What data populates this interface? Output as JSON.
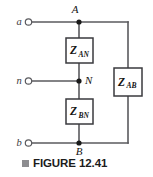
{
  "figure": {
    "caption_marker": "square-marker",
    "caption": "FIGURE 12.41",
    "type": "circuit-diagram"
  },
  "terminals": [
    {
      "id": "a",
      "label": "a",
      "x": 27,
      "y": 22
    },
    {
      "id": "n",
      "label": "n",
      "x": 27,
      "y": 81
    },
    {
      "id": "b",
      "label": "b",
      "x": 27,
      "y": 143
    }
  ],
  "nodes": [
    {
      "id": "A",
      "label": "A",
      "x": 79,
      "y": 22
    },
    {
      "id": "N",
      "label": "N",
      "x": 79,
      "y": 81
    },
    {
      "id": "B",
      "label": "B",
      "x": 79,
      "y": 143
    }
  ],
  "impedances": [
    {
      "id": "Z_AN",
      "symbol": "Z",
      "subscript": "AN",
      "between": "A-N",
      "box": {
        "x": 66,
        "y": 38,
        "w": 27,
        "h": 25
      }
    },
    {
      "id": "Z_BN",
      "symbol": "Z",
      "subscript": "BN",
      "between": "B-N",
      "box": {
        "x": 66,
        "y": 99,
        "w": 27,
        "h": 25
      }
    },
    {
      "id": "Z_AB",
      "symbol": "Z",
      "subscript": "AB",
      "between": "A-B",
      "box": {
        "x": 114,
        "y": 68,
        "w": 28,
        "h": 28
      }
    }
  ],
  "colors": {
    "wire": "#5a5a5e",
    "box_stroke": "#3a3a3e",
    "node_dot": "#1a1a1a",
    "text": "#141414",
    "caption_marker": "#8d8d90",
    "background": "#ffffff"
  }
}
